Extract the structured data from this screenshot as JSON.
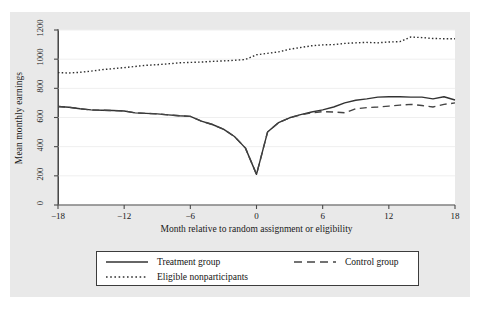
{
  "chart_data": {
    "type": "line",
    "title": "",
    "xlabel": "Month relative to random assignment or eligibility",
    "ylabel": "Mean monthly earnings",
    "xlim": [
      -18,
      18
    ],
    "ylim": [
      0,
      1200
    ],
    "xticks": [
      "-18",
      "-12",
      "-6",
      "0",
      "6",
      "12",
      "18"
    ],
    "xtick_values": [
      -18,
      -12,
      -6,
      0,
      6,
      12,
      18
    ],
    "yticks": [
      "0",
      "200",
      "400",
      "600",
      "800",
      "1000",
      "1200"
    ],
    "ytick_values": [
      0,
      200,
      400,
      600,
      800,
      1000,
      1200
    ],
    "grid": "horizontal",
    "legend_position": "below-axes",
    "x": [
      -18,
      -17,
      -16,
      -15,
      -14,
      -13,
      -12,
      -11,
      -10,
      -9,
      -8,
      -7,
      -6,
      -5,
      -4,
      -3,
      -2,
      -1,
      0,
      1,
      2,
      3,
      4,
      5,
      6,
      7,
      8,
      9,
      10,
      11,
      12,
      13,
      14,
      15,
      16,
      17,
      18
    ],
    "series": [
      {
        "name": "Treatment group",
        "style": "solid",
        "color": "#333333",
        "values": [
          675,
          670,
          660,
          652,
          650,
          648,
          645,
          632,
          628,
          625,
          618,
          612,
          608,
          575,
          552,
          520,
          470,
          390,
          210,
          500,
          565,
          598,
          620,
          638,
          652,
          672,
          700,
          718,
          728,
          740,
          742,
          742,
          740,
          740,
          728,
          742,
          720
        ]
      },
      {
        "name": "Control group",
        "style": "dashed",
        "color": "#444444",
        "values": [
          675,
          670,
          660,
          652,
          650,
          648,
          645,
          632,
          628,
          625,
          618,
          612,
          608,
          575,
          552,
          520,
          470,
          390,
          210,
          500,
          565,
          598,
          618,
          632,
          640,
          638,
          632,
          660,
          668,
          672,
          678,
          685,
          690,
          682,
          672,
          690,
          700
        ]
      },
      {
        "name": "Eligible nonparticipants",
        "style": "dotted",
        "color": "#2e2e2e",
        "values": [
          908,
          905,
          910,
          918,
          928,
          935,
          942,
          950,
          958,
          962,
          968,
          975,
          978,
          980,
          985,
          988,
          992,
          998,
          1030,
          1040,
          1050,
          1068,
          1080,
          1092,
          1098,
          1100,
          1108,
          1112,
          1115,
          1112,
          1118,
          1120,
          1152,
          1148,
          1142,
          1140,
          1140
        ]
      }
    ],
    "legend": [
      {
        "label": "Treatment group",
        "style": "solid"
      },
      {
        "label": "Control group",
        "style": "dashed"
      },
      {
        "label": "Eligible nonparticipants",
        "style": "dotted"
      }
    ],
    "colors": {
      "figure_background": "#e9e9e9",
      "panel_background": "#ffffff",
      "axis": "#4a4a4a",
      "gridline": "#efefef",
      "text": "#1a1a1a"
    }
  }
}
